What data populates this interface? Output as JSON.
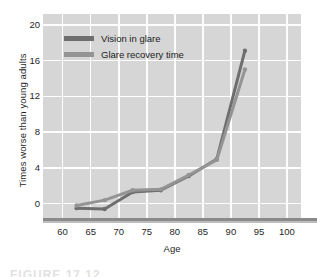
{
  "chart_data": {
    "type": "line",
    "title": "",
    "xlabel": "Age",
    "ylabel": "Times worse than young adults",
    "xlim": [
      56.5,
      102.5
    ],
    "ylim": [
      -1.6,
      21.2
    ],
    "xticks": [
      60,
      65,
      70,
      75,
      80,
      85,
      90,
      95,
      100
    ],
    "yticks": [
      0,
      4,
      8,
      12,
      16,
      20
    ],
    "grid": true,
    "legend_position": "upper-left-inside",
    "series": [
      {
        "name": "Vision in glare",
        "color": "#6e6e6e",
        "x": [
          62.5,
          67.5,
          72.5,
          77.5,
          82.5,
          87.5,
          92.5
        ],
        "values": [
          -0.5,
          -0.6,
          1.3,
          1.5,
          3.1,
          5.0,
          17.1
        ]
      },
      {
        "name": "Glare recovery time",
        "color": "#949494",
        "x": [
          62.5,
          67.5,
          72.5,
          77.5,
          82.5,
          87.5,
          92.5
        ],
        "values": [
          -0.2,
          0.4,
          1.5,
          1.6,
          3.2,
          4.9,
          15.0
        ]
      }
    ]
  },
  "axes": {
    "y_title": "Times worse than young adults",
    "x_title": "Age",
    "y_tick_labels": [
      "20",
      "16",
      "12",
      "8",
      "4",
      "0"
    ],
    "x_tick_labels": [
      "60",
      "65",
      "70",
      "75",
      "80",
      "85",
      "90",
      "95",
      "100"
    ]
  },
  "legend": {
    "items": [
      {
        "label": "Vision in glare",
        "color": "#6e6e6e"
      },
      {
        "label": "Glare recovery time",
        "color": "#949494"
      }
    ]
  },
  "caption": {
    "text": "FIGURE 17.12"
  },
  "colors": {
    "plot_background": "#d6d6d6",
    "gridline": "#fdfdfd",
    "baseline_rule": "#8a8a8a",
    "page_background": "#ffffff",
    "text": "#1f1f1f"
  }
}
